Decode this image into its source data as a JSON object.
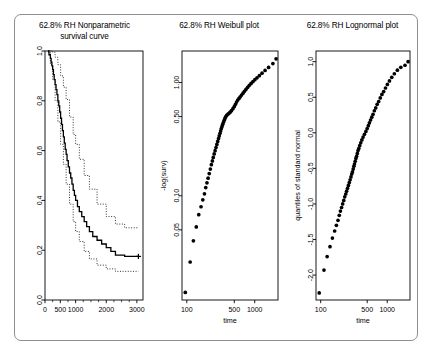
{
  "figure": {
    "background": "#ffffff",
    "frame_border_color": "#8e8e8e",
    "panel_count": 3
  },
  "chart_data": [
    {
      "type": "line",
      "panel_index": 1,
      "title": "62.8% RH Nonparametric survival curve",
      "title_line1": "62.8% RH Nonparametric",
      "title_line2": "survival curve",
      "xlabel": "",
      "ylabel": "",
      "xlim": [
        0,
        3200
      ],
      "ylim": [
        0.0,
        1.0
      ],
      "xticks": [
        0,
        500,
        1000,
        2000,
        3000
      ],
      "xticklabels": [
        "0",
        "500",
        "1000",
        "2000",
        "3000"
      ],
      "yticks": [
        0.0,
        0.2,
        0.4,
        0.6,
        0.8,
        1.0
      ],
      "yticklabels": [
        "0.0",
        "0.2",
        "0.4",
        "0.6",
        "0.8",
        "1.0"
      ],
      "grid": false,
      "legend": "none",
      "series": [
        {
          "name": "Kaplan-Meier estimate",
          "style": "solid-step",
          "color": "#000000",
          "x": [
            95,
            130,
            175,
            200,
            225,
            250,
            275,
            300,
            330,
            360,
            390,
            420,
            450,
            480,
            510,
            540,
            570,
            600,
            630,
            660,
            690,
            720,
            760,
            800,
            840,
            880,
            920,
            960,
            1000,
            1060,
            1120,
            1200,
            1280,
            1360,
            1450,
            1560,
            1700,
            1850,
            2000,
            2150,
            2300,
            2600,
            3050
          ],
          "y": [
            1.0,
            0.985,
            0.97,
            0.955,
            0.94,
            0.925,
            0.905,
            0.885,
            0.865,
            0.845,
            0.825,
            0.8,
            0.78,
            0.755,
            0.73,
            0.705,
            0.68,
            0.655,
            0.63,
            0.605,
            0.585,
            0.56,
            0.535,
            0.51,
            0.49,
            0.465,
            0.44,
            0.42,
            0.4,
            0.375,
            0.355,
            0.335,
            0.315,
            0.295,
            0.275,
            0.255,
            0.24,
            0.225,
            0.21,
            0.195,
            0.18,
            0.175,
            0.175
          ]
        },
        {
          "name": "upper 95% confidence limit",
          "style": "dotted",
          "color": "#000000",
          "x": [
            95,
            175,
            250,
            330,
            420,
            510,
            600,
            690,
            800,
            920,
            1000,
            1120,
            1280,
            1450,
            1700,
            2000,
            2300,
            2600,
            3050
          ],
          "y": [
            1.0,
            1.0,
            0.995,
            0.975,
            0.945,
            0.9,
            0.855,
            0.805,
            0.735,
            0.665,
            0.625,
            0.565,
            0.5,
            0.445,
            0.385,
            0.335,
            0.305,
            0.29,
            0.29
          ]
        },
        {
          "name": "lower 95% confidence limit",
          "style": "dotted",
          "color": "#000000",
          "x": [
            95,
            175,
            250,
            330,
            420,
            510,
            600,
            690,
            800,
            920,
            1000,
            1120,
            1280,
            1450,
            1700,
            2000,
            2300,
            2600,
            3050
          ],
          "y": [
            0.995,
            0.945,
            0.885,
            0.8,
            0.715,
            0.625,
            0.545,
            0.465,
            0.385,
            0.315,
            0.275,
            0.235,
            0.195,
            0.165,
            0.14,
            0.125,
            0.115,
            0.115,
            0.115
          ]
        }
      ],
      "censor_marker": {
        "x": 3050,
        "y": 0.175,
        "glyph": "+"
      }
    },
    {
      "type": "scatter",
      "panel_index": 2,
      "title": "62.8% RH Weibull plot",
      "xlabel": "time",
      "ylabel": "-log(surv)",
      "xscale": "log",
      "yscale": "log",
      "xlim": [
        85,
        2200
      ],
      "ylim": [
        0.012,
        1.9
      ],
      "xticks": [
        100,
        500,
        1000
      ],
      "xticklabels": [
        "100",
        "500",
        "1000"
      ],
      "yticks": [
        0.05,
        0.1,
        0.5,
        1.0
      ],
      "yticklabels": [
        "0.05",
        "0.10",
        "0.50",
        "1.00"
      ],
      "grid": false,
      "legend": "none",
      "points": [
        [
          95,
          0.014
        ],
        [
          112,
          0.026
        ],
        [
          125,
          0.04
        ],
        [
          138,
          0.053
        ],
        [
          150,
          0.068
        ],
        [
          162,
          0.08
        ],
        [
          172,
          0.092
        ],
        [
          182,
          0.104
        ],
        [
          190,
          0.118
        ],
        [
          198,
          0.13
        ],
        [
          206,
          0.143
        ],
        [
          214,
          0.157
        ],
        [
          222,
          0.172
        ],
        [
          230,
          0.188
        ],
        [
          238,
          0.203
        ],
        [
          245,
          0.218
        ],
        [
          253,
          0.234
        ],
        [
          261,
          0.25
        ],
        [
          269,
          0.267
        ],
        [
          277,
          0.284
        ],
        [
          285,
          0.302
        ],
        [
          293,
          0.32
        ],
        [
          300,
          0.338
        ],
        [
          308,
          0.356
        ],
        [
          315,
          0.374
        ],
        [
          322,
          0.392
        ],
        [
          330,
          0.41
        ],
        [
          338,
          0.428
        ],
        [
          346,
          0.446
        ],
        [
          355,
          0.464
        ],
        [
          364,
          0.482
        ],
        [
          374,
          0.498
        ],
        [
          386,
          0.512
        ],
        [
          400,
          0.524
        ],
        [
          416,
          0.534
        ],
        [
          434,
          0.548
        ],
        [
          455,
          0.565
        ],
        [
          478,
          0.588
        ],
        [
          500,
          0.614
        ],
        [
          520,
          0.642
        ],
        [
          540,
          0.672
        ],
        [
          562,
          0.7
        ],
        [
          586,
          0.724
        ],
        [
          612,
          0.748
        ],
        [
          640,
          0.775
        ],
        [
          672,
          0.805
        ],
        [
          706,
          0.838
        ],
        [
          744,
          0.872
        ],
        [
          786,
          0.908
        ],
        [
          832,
          0.945
        ],
        [
          884,
          0.982
        ],
        [
          942,
          1.02
        ],
        [
          1005,
          1.06
        ],
        [
          1080,
          1.1
        ],
        [
          1170,
          1.15
        ],
        [
          1280,
          1.21
        ],
        [
          1420,
          1.28
        ],
        [
          1600,
          1.36
        ],
        [
          1850,
          1.47
        ],
        [
          2060,
          1.62
        ]
      ]
    },
    {
      "type": "scatter",
      "panel_index": 3,
      "title": "62.8% RH Lognormal plot",
      "xlabel": "time",
      "ylabel": "quantiles of standard normal",
      "xscale": "log",
      "yscale": "linear",
      "xlim": [
        85,
        2200
      ],
      "ylim": [
        -2.35,
        1.15
      ],
      "xticks": [
        100,
        500,
        1000
      ],
      "xticklabels": [
        "100",
        "500",
        "1000"
      ],
      "yticks": [
        -2.0,
        -1.5,
        -1.0,
        -0.5,
        0.0,
        0.5,
        1.0
      ],
      "yticklabels": [
        "-2.0",
        "-1.5",
        "-1.0",
        "-0.5",
        "0.0",
        "0.5",
        "1.0"
      ],
      "grid": false,
      "legend": "none",
      "points": [
        [
          95,
          -2.25
        ],
        [
          112,
          -1.93
        ],
        [
          125,
          -1.74
        ],
        [
          138,
          -1.6
        ],
        [
          150,
          -1.48
        ],
        [
          162,
          -1.38
        ],
        [
          172,
          -1.3
        ],
        [
          182,
          -1.23
        ],
        [
          190,
          -1.16
        ],
        [
          198,
          -1.1
        ],
        [
          206,
          -1.05
        ],
        [
          214,
          -1.0
        ],
        [
          222,
          -0.95
        ],
        [
          230,
          -0.9
        ],
        [
          238,
          -0.86
        ],
        [
          245,
          -0.82
        ],
        [
          253,
          -0.78
        ],
        [
          261,
          -0.74
        ],
        [
          269,
          -0.7
        ],
        [
          277,
          -0.66
        ],
        [
          285,
          -0.62
        ],
        [
          293,
          -0.58
        ],
        [
          300,
          -0.55
        ],
        [
          308,
          -0.51
        ],
        [
          315,
          -0.47
        ],
        [
          322,
          -0.44
        ],
        [
          330,
          -0.4
        ],
        [
          338,
          -0.36
        ],
        [
          346,
          -0.33
        ],
        [
          355,
          -0.29
        ],
        [
          364,
          -0.25
        ],
        [
          374,
          -0.22
        ],
        [
          386,
          -0.18
        ],
        [
          400,
          -0.14
        ],
        [
          416,
          -0.1
        ],
        [
          434,
          -0.06
        ],
        [
          455,
          -0.02
        ],
        [
          478,
          0.02
        ],
        [
          500,
          0.06
        ],
        [
          520,
          0.1
        ],
        [
          540,
          0.14
        ],
        [
          562,
          0.18
        ],
        [
          586,
          0.22
        ],
        [
          612,
          0.26
        ],
        [
          640,
          0.31
        ],
        [
          672,
          0.35
        ],
        [
          706,
          0.4
        ],
        [
          744,
          0.44
        ],
        [
          786,
          0.49
        ],
        [
          832,
          0.54
        ],
        [
          884,
          0.58
        ],
        [
          942,
          0.63
        ],
        [
          1005,
          0.68
        ],
        [
          1080,
          0.73
        ],
        [
          1170,
          0.78
        ],
        [
          1280,
          0.83
        ],
        [
          1420,
          0.88
        ],
        [
          1600,
          0.92
        ],
        [
          1850,
          0.95
        ],
        [
          2060,
          1.0
        ]
      ]
    }
  ]
}
